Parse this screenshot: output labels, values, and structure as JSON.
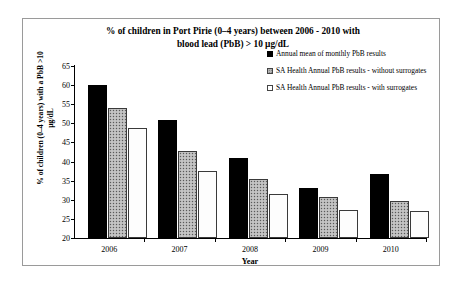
{
  "chart_data": {
    "type": "bar",
    "title": "% of children in Port Pirie (0–4 years) between 2006 - 2010 with blood lead (PbB) > 10 µg/dL",
    "title_line1": "% of children in Port Pirie (0–4 years) between 2006 - 2010 with",
    "title_line2": "blood lead (PbB) > 10 µg/dL",
    "xlabel": "Year",
    "ylabel": "% of children (0–4 years) with a PbB >10 µg/dL",
    "ylabel_line1": "% of children (0–4 years) with a PbB >10",
    "ylabel_line2": "µg/dL",
    "categories": [
      "2006",
      "2007",
      "2008",
      "2009",
      "2010"
    ],
    "ylim": [
      20,
      65
    ],
    "yticks": [
      65,
      60,
      55,
      50,
      45,
      40,
      35,
      30,
      25,
      20
    ],
    "grid": false,
    "legend_position": "upper right",
    "series": [
      {
        "name": "Annual mean of monthly PbB results",
        "swatch": "black-solid",
        "values": [
          60.0,
          51.0,
          41.0,
          33.0,
          36.8
        ]
      },
      {
        "name": "SA Health Annual PbB results - without surrogates",
        "swatch": "gray-speckled",
        "values": [
          54.0,
          42.8,
          35.5,
          30.8,
          29.8
        ]
      },
      {
        "name": "SA Health Annual PbB results - with surrogates",
        "swatch": "white-outline",
        "values": [
          48.8,
          37.5,
          31.5,
          27.2,
          27.0
        ]
      }
    ]
  },
  "legend": {
    "items": [
      {
        "label": "Annual mean of monthly PbB results"
      },
      {
        "label": "SA Health Annual PbB results - without surrogates"
      },
      {
        "label": "SA Health Annual PbB results - with surrogates"
      }
    ]
  }
}
